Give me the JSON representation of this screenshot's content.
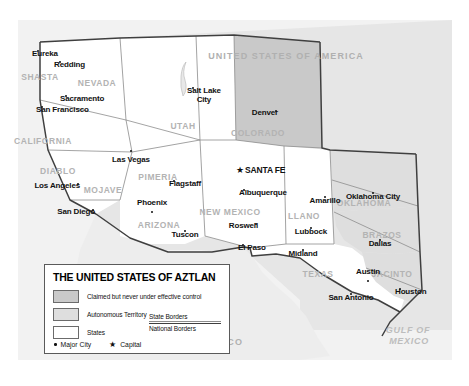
{
  "map": {
    "title": "The United States of Aztlan",
    "colors": {
      "claimed_fill": "#c9c9c9",
      "autonomous_fill": "#dedede",
      "state_fill": "#ffffff",
      "usa_fill": "#e6e6e6",
      "mexico_fill": "#ededed",
      "ocean_fill": "#f2f2f2",
      "state_border": "#8d8d8d",
      "national_border": "#3f3f3f",
      "city_text": "#111111",
      "region_text": "#b3b3b3"
    },
    "countries": [
      {
        "name": "UNITED STATES OF AMERICA",
        "x": 286,
        "y": 52
      },
      {
        "name": "MEXICO",
        "x": 222,
        "y": 338
      }
    ],
    "oceans": [
      {
        "name": "GULF OF",
        "x": 408,
        "y": 326
      },
      {
        "name": "MEXICO",
        "x": 409,
        "y": 337
      }
    ],
    "regions": [
      {
        "name": "SHASTA",
        "x": 40,
        "y": 73,
        "claimed": true
      },
      {
        "name": "NEVADA",
        "x": 97,
        "y": 79,
        "claimed": true
      },
      {
        "name": "UTAH",
        "x": 183,
        "y": 122,
        "claimed": true
      },
      {
        "name": "COLORADO",
        "x": 258,
        "y": 129,
        "claimed": true
      },
      {
        "name": "CALIFORNIA",
        "x": 43,
        "y": 137,
        "claimed": true
      },
      {
        "name": "DIABLO",
        "x": 58,
        "y": 167,
        "claimed": true
      },
      {
        "name": "MOJAVE",
        "x": 103,
        "y": 186,
        "claimed": true
      },
      {
        "name": "PIMERIA",
        "x": 158,
        "y": 173,
        "claimed": true
      },
      {
        "name": "ARIZONA",
        "x": 159,
        "y": 221,
        "claimed": true
      },
      {
        "name": "NEW MEXICO",
        "x": 230,
        "y": 208,
        "claimed": true
      },
      {
        "name": "LLANO",
        "x": 304,
        "y": 212,
        "claimed": true
      },
      {
        "name": "OKLAHOMA",
        "x": 364,
        "y": 199,
        "claimed": true
      },
      {
        "name": "BRAZOS",
        "x": 382,
        "y": 231,
        "claimed": true
      },
      {
        "name": "JACINTO",
        "x": 392,
        "y": 270,
        "claimed": true
      },
      {
        "name": "TEXAS",
        "x": 318,
        "y": 270,
        "claimed": true
      }
    ],
    "cities": [
      {
        "name": "Eureka",
        "x": 38,
        "y": 51,
        "dx": -6,
        "dy": 3,
        "capital": false,
        "align": "left"
      },
      {
        "name": "Redding",
        "x": 60,
        "y": 62,
        "dx": -6,
        "dy": 3,
        "capital": false,
        "align": "left"
      },
      {
        "name": "Sacramento",
        "x": 66,
        "y": 96,
        "dx": -6,
        "dy": 3,
        "capital": false,
        "align": "left"
      },
      {
        "name": "San Francisco",
        "x": 42,
        "y": 107,
        "dx": -6,
        "dy": 3,
        "capital": false,
        "align": "left"
      },
      {
        "name": "Las Vegas",
        "x": 131,
        "y": 151,
        "dx": 0,
        "dy": 9,
        "capital": false,
        "align": "center"
      },
      {
        "name": "Salt Lake City",
        "x": 193,
        "y": 88,
        "dx": -6,
        "dy": 2,
        "capital": false,
        "align": "left",
        "two_line": true,
        "line1": "Salt Lake",
        "line2": "City"
      },
      {
        "name": "Denver",
        "x": 276,
        "y": 111,
        "dx": 2,
        "dy": 2,
        "capital": false,
        "align": "right"
      },
      {
        "name": "Los Angeles",
        "x": 78,
        "y": 184,
        "dx": 2,
        "dy": 2,
        "capital": false,
        "align": "right"
      },
      {
        "name": "San Diego",
        "x": 93,
        "y": 210,
        "dx": 2,
        "dy": 2,
        "capital": false,
        "align": "right"
      },
      {
        "name": "Phoenix",
        "x": 152,
        "y": 212,
        "dx": 0,
        "dy": -9,
        "capital": false,
        "align": "center"
      },
      {
        "name": "Tuscon",
        "x": 185,
        "y": 231,
        "dx": 0,
        "dy": 4,
        "capital": false,
        "align": "center"
      },
      {
        "name": "Flagstaff",
        "x": 174,
        "y": 181,
        "dx": -5,
        "dy": 3,
        "capital": false,
        "align": "left"
      },
      {
        "name": "SANTA FE",
        "x": 245,
        "y": 170,
        "dx": 0,
        "dy": 0,
        "capital": true,
        "align": "left"
      },
      {
        "name": "Albuquerque",
        "x": 244,
        "y": 190,
        "dx": -5,
        "dy": 3,
        "capital": false,
        "align": "left"
      },
      {
        "name": "Amarillo",
        "x": 325,
        "y": 197,
        "dx": 0,
        "dy": 4,
        "capital": false,
        "align": "center"
      },
      {
        "name": "Oklahoma City",
        "x": 373,
        "y": 193,
        "dx": 0,
        "dy": 4,
        "capital": false,
        "align": "center"
      },
      {
        "name": "Roswell",
        "x": 256,
        "y": 224,
        "dx": 2,
        "dy": 2,
        "capital": false,
        "align": "right"
      },
      {
        "name": "Lubbock",
        "x": 311,
        "y": 228,
        "dx": 0,
        "dy": 4,
        "capital": false,
        "align": "center"
      },
      {
        "name": "El Paso",
        "x": 243,
        "y": 245,
        "dx": -5,
        "dy": 3,
        "capital": false,
        "align": "left"
      },
      {
        "name": "Midland",
        "x": 303,
        "y": 250,
        "dx": 0,
        "dy": 4,
        "capital": false,
        "align": "center"
      },
      {
        "name": "Dallas",
        "x": 380,
        "y": 240,
        "dx": 0,
        "dy": 4,
        "capital": false,
        "align": "center"
      },
      {
        "name": "Austin",
        "x": 368,
        "y": 281,
        "dx": 0,
        "dy": -9,
        "capital": false,
        "align": "center"
      },
      {
        "name": "San Antonio",
        "x": 351,
        "y": 294,
        "dx": 0,
        "dy": 4,
        "capital": false,
        "align": "center"
      },
      {
        "name": "Houston",
        "x": 400,
        "y": 289,
        "dx": -5,
        "dy": 3,
        "capital": false,
        "align": "left"
      }
    ]
  },
  "legend": {
    "title": "THE UNITED STATES OF AZTLAN",
    "rows": [
      {
        "key": "claimed",
        "label": "Claimed but never under effective control"
      },
      {
        "key": "auto",
        "label": "Autonomous Territory"
      },
      {
        "key": "state",
        "label": "States"
      }
    ],
    "borders": {
      "state_label": "State Borders",
      "national_label": "National Borders"
    },
    "keys": {
      "major_city": "Major City",
      "capital": "Capital",
      "star_glyph": "★"
    }
  }
}
